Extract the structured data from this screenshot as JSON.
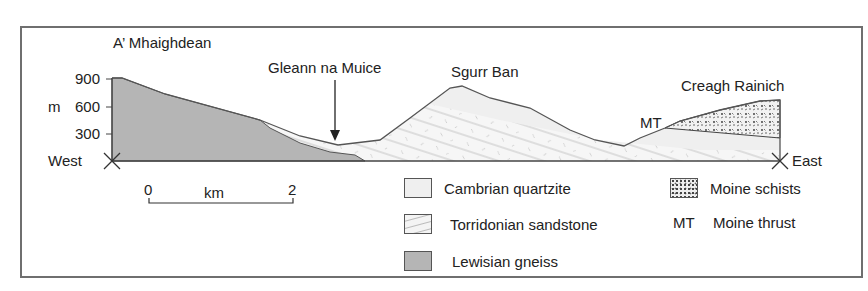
{
  "diagram": {
    "type": "geological cross-section",
    "direction": {
      "left": "West",
      "right": "East"
    },
    "axis": {
      "unit_label": "m",
      "ticks": [
        "900",
        "600",
        "300"
      ]
    },
    "places": {
      "a_mhaighdean": "A’ Mhaighdean",
      "gleann": "Gleann na Muice",
      "sgurr_ban": "Sgurr Ban",
      "creagh": "Creagh Rainich",
      "mt_marker": "MT"
    },
    "scale_bar": {
      "start": "0",
      "end": "2",
      "unit": "km"
    },
    "legend": [
      {
        "key": "",
        "label": "Cambrian quartzite"
      },
      {
        "key": "",
        "label": "Torridonian sandstone"
      },
      {
        "key": "",
        "label": "Lewisian gneiss"
      },
      {
        "key": "",
        "label": "Moine schists"
      },
      {
        "key": "MT",
        "label": "Moine thrust"
      }
    ],
    "colors": {
      "lewisian": "#b5b5b5",
      "quartzite": "#efefef",
      "torridonian": "#f6f6f6",
      "outline": "#555555"
    }
  }
}
